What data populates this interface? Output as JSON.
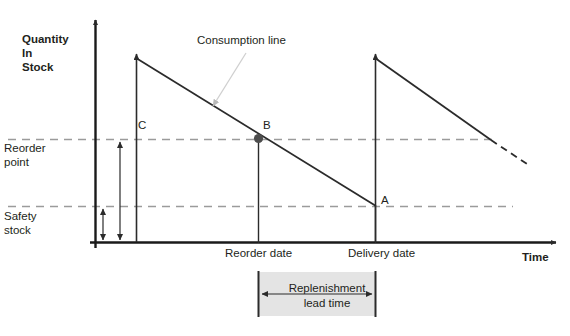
{
  "diagram": {
    "title_axis_y": "Quantity\nIn\nStock",
    "title_axis_x": "Time",
    "annotation_consumption_line": "Consumption line",
    "level_reorder_point": "Reorder\npoint",
    "level_safety_stock": "Safety\nstock",
    "point_a": "A",
    "point_b": "B",
    "point_c": "C",
    "tick_reorder_date": "Reorder date",
    "tick_delivery_date": "Delivery date",
    "band_replenishment_lead_time": "Replenishment\nlead time",
    "colors": {
      "ink": "#231f20",
      "line": "#2b2b2b",
      "dashed_level": "#9b9b9b",
      "pointer": "#c9c9c9",
      "band_fill": "#e4e4e4",
      "background": "#ffffff"
    },
    "geometry": {
      "y_axis_x": 95,
      "x_axis_y": 242,
      "reorder_point_y": 139,
      "safety_stock_y": 206,
      "replenish_1_x": 136,
      "reorder_date_x": 258,
      "delivery_date_x": 375,
      "stock_top_y": 58,
      "line_end_x": 530
    }
  }
}
